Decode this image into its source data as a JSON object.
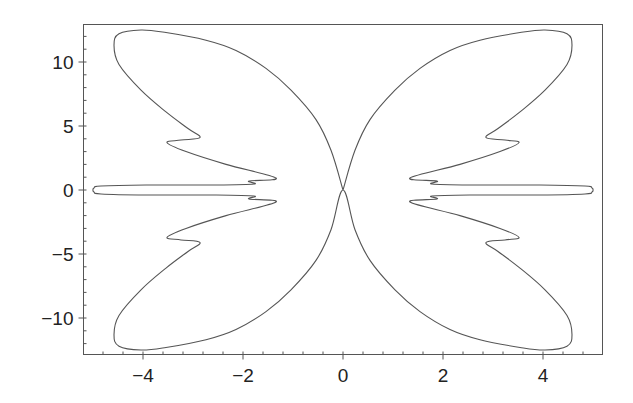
{
  "chart_data": {
    "type": "line",
    "title": "",
    "xlabel": "",
    "ylabel": "",
    "xlim": [
      -5.2,
      5.2
    ],
    "ylim": [
      -12.9,
      13.0
    ],
    "grid": false,
    "legend": null,
    "x_ticks": [
      {
        "value": -4,
        "label": "−4"
      },
      {
        "value": -2,
        "label": "−2"
      },
      {
        "value": 0,
        "label": "0"
      },
      {
        "value": 2,
        "label": "2"
      },
      {
        "value": 4,
        "label": "4"
      }
    ],
    "y_ticks": [
      {
        "value": 10,
        "label": "10"
      },
      {
        "value": 5,
        "label": "5"
      },
      {
        "value": 0,
        "label": "0"
      },
      {
        "value": -5,
        "label": "−5"
      },
      {
        "value": -10,
        "label": "−10"
      }
    ],
    "x_minor_step": 0.4,
    "y_minor_step": 1,
    "series": [
      {
        "name": "curve",
        "color": "#555555",
        "symmetry": "both-axes",
        "upper_right_quadrant_points": [
          [
            0,
            0
          ],
          [
            0.24,
            3.1
          ],
          [
            0.54,
            5.5
          ],
          [
            1.04,
            7.8
          ],
          [
            1.54,
            9.5
          ],
          [
            2.14,
            10.9
          ],
          [
            2.74,
            11.7
          ],
          [
            3.54,
            12.3
          ],
          [
            4.04,
            12.5
          ],
          [
            4.48,
            12.2
          ],
          [
            4.58,
            11.3
          ],
          [
            4.48,
            9.8
          ],
          [
            4.04,
            7.8
          ],
          [
            3.54,
            6.1
          ],
          [
            3.1,
            4.8
          ],
          [
            2.86,
            4.1
          ],
          [
            3.24,
            3.9
          ],
          [
            3.52,
            3.7
          ],
          [
            3.14,
            3.0
          ],
          [
            2.34,
            2.0
          ],
          [
            1.34,
            0.94
          ],
          [
            1.88,
            0.7
          ],
          [
            1.78,
            0.47
          ],
          [
            2.54,
            0.39
          ],
          [
            3.94,
            0.39
          ],
          [
            4.84,
            0.31
          ],
          [
            4.98,
            0.16
          ],
          [
            5.0,
            0
          ]
        ]
      }
    ]
  }
}
